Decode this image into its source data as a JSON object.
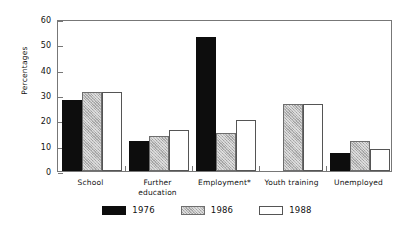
{
  "chart_data": {
    "type": "bar",
    "title": "",
    "subtitle": "",
    "xlabel": "",
    "ylabel": "Percentages",
    "ylim": [
      0,
      60
    ],
    "yticks": [
      0,
      10,
      20,
      30,
      40,
      50,
      60
    ],
    "grid": false,
    "legend_position": "bottom",
    "categories": [
      "School",
      "Further education",
      "Employment*",
      "Youth training",
      "Unemployed"
    ],
    "category_lines": [
      [
        "School"
      ],
      [
        "Further",
        "education"
      ],
      [
        "Employment*"
      ],
      [
        "Youth training"
      ],
      [
        "Unemployed"
      ]
    ],
    "series": [
      {
        "name": "1976",
        "color": "#0d0d0d",
        "values": [
          28,
          12,
          53,
          null,
          7
        ]
      },
      {
        "name": "1986",
        "color": "#b9b9b9",
        "values": [
          31,
          14,
          15,
          26.5,
          12
        ]
      },
      {
        "name": "1988",
        "color": "#ffffff",
        "values": [
          31,
          16,
          20,
          26.5,
          8.5
        ]
      }
    ]
  },
  "legend": {
    "items": [
      {
        "label": "1976"
      },
      {
        "label": "1986"
      },
      {
        "label": "1988"
      }
    ]
  },
  "axis": {
    "y_title": "Percentages",
    "y_tick_labels": [
      "0",
      "10",
      "20",
      "30",
      "40",
      "50",
      "60"
    ]
  }
}
